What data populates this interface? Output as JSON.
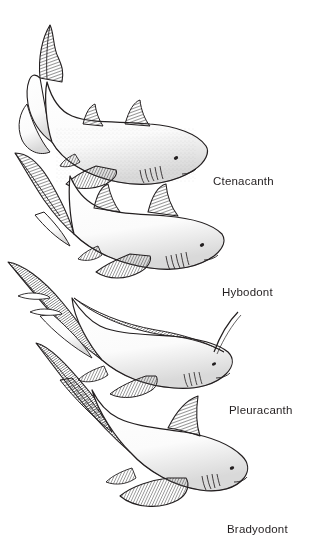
{
  "figure": {
    "kind": "scientific-line-illustration",
    "background_color": "#ffffff",
    "ink_color": "#231f20",
    "width": 310,
    "height": 553,
    "arrangement": "four shark bodies stacked diagonally from upper-left to lower-right, each labeled at right"
  },
  "labels": [
    {
      "id": "ctenacanth",
      "text": "Ctenacanth"
    },
    {
      "id": "hybodont",
      "text": "Hybodont"
    },
    {
      "id": "pleuracanth",
      "text": "Pleuracanth"
    },
    {
      "id": "bradyodont",
      "text": "Bradyodont"
    }
  ],
  "specimens": [
    {
      "name": "Ctenacanth",
      "order": 1,
      "body_shape": "robust fusiform shark, curved body, head lower-right",
      "tail": "large upswept heterocercal caudal fin at upper-left",
      "dorsal_fins": 2,
      "features": [
        "two small triangular hatched dorsal fins",
        "broad pectoral fin",
        "five gill slits",
        "small round eye"
      ]
    },
    {
      "name": "Hybodont",
      "order": 2,
      "body_shape": "stout streamlined shark, head lower-right",
      "tail": "long tapering heterocercal caudal fin at upper-left",
      "dorsal_fins": 2,
      "features": [
        "two tall hatched dorsal fins",
        "pectoral and pelvic fins",
        "gill slits",
        "small round eye"
      ]
    },
    {
      "name": "Pleuracanth",
      "order": 3,
      "body_shape": "elongate eel-like body, head lower-right",
      "tail": "very long low diphycercal tail extending to upper-left",
      "dorsal_fins": 1,
      "features": [
        "continuous low hatched dorsal ridge along back",
        "long occipital spine behind head",
        "slender paired fins",
        "gill slits",
        "small round eye"
      ]
    },
    {
      "name": "Bradyodont",
      "order": 4,
      "body_shape": "thick-bodied shark with blunt rounded snout, head lower-right",
      "tail": "long low tail fin extending to upper-left",
      "dorsal_fins": 1,
      "features": [
        "single hatched dorsal fin set far back",
        "very large broad pectoral fin",
        "gill slits",
        "small round eye"
      ]
    }
  ]
}
